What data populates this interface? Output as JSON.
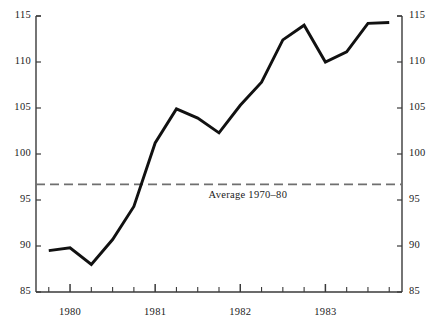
{
  "chart_data": {
    "type": "line",
    "title": "",
    "subtitle": "",
    "xlabel": "",
    "ylabel": "",
    "ylim": [
      85,
      115
    ],
    "xlim": [
      1979.6,
      1983.9
    ],
    "grid": false,
    "legend_position": "none",
    "y_ticks": [
      85,
      90,
      95,
      100,
      105,
      110,
      115
    ],
    "y_tick_labels": [
      "85",
      "90",
      "95",
      "100",
      "105",
      "110",
      "115"
    ],
    "y_axis_right_tick_labels": [
      "85",
      "90",
      "95",
      "100",
      "105",
      "110",
      "115"
    ],
    "x_tick_labels": [
      "1980",
      "1981",
      "1982",
      "1983"
    ],
    "x_tick_values": [
      1980,
      1981,
      1982,
      1983
    ],
    "x_minor_ticks": [
      1979.75,
      1980.0,
      1980.25,
      1980.5,
      1980.75,
      1981.0,
      1981.25,
      1981.5,
      1981.75,
      1982.0,
      1982.25,
      1982.5,
      1982.75,
      1983.0,
      1983.25,
      1983.5,
      1983.75
    ],
    "series": [
      {
        "name": "index",
        "color": "#111111",
        "x": [
          1979.75,
          1980.0,
          1980.25,
          1980.5,
          1980.75,
          1981.0,
          1981.25,
          1981.5,
          1981.75,
          1982.0,
          1982.25,
          1982.5,
          1982.75,
          1983.0,
          1983.25,
          1983.5,
          1983.75
        ],
        "values": [
          89.5,
          89.8,
          88.0,
          90.7,
          94.3,
          101.2,
          104.9,
          103.9,
          102.3,
          105.3,
          107.8,
          112.4,
          114.0,
          110.0,
          111.1,
          114.2,
          114.3
        ]
      }
    ],
    "reference_lines": [
      {
        "name": "average-1970-80",
        "label": "Average 1970–80",
        "value": 96.7,
        "style": "dashed",
        "color": "#6f6f6f"
      }
    ],
    "annotations": [
      {
        "name": "average-annotation",
        "text": "Average 1970–80",
        "x": 1982.25,
        "y": 95.4
      }
    ]
  },
  "axes": {
    "left": {
      "labels": [
        "115",
        "110",
        "105",
        "100",
        "95",
        "90",
        "85"
      ],
      "pixel_y": [
        16,
        62,
        108,
        154,
        200,
        246,
        292
      ]
    },
    "right": {
      "labels": [
        "115",
        "110",
        "105",
        "100",
        "95",
        "90",
        "85"
      ],
      "pixel_y": [
        16,
        62,
        108,
        154,
        200,
        246,
        292
      ]
    },
    "bottom": {
      "labels": [
        "1980",
        "1981",
        "1982",
        "1983"
      ],
      "pixel_x": [
        78,
        170,
        268,
        360
      ]
    }
  },
  "annotation": {
    "average_text": "Average 1970–80"
  },
  "colors": {
    "line": "#111111",
    "axis": "#3a3a3a",
    "reference": "#6f6f6f",
    "background": "#ffffff",
    "text": "#1a1a1a"
  }
}
